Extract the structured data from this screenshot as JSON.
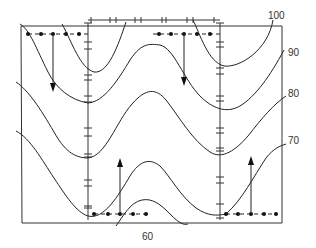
{
  "diagram": {
    "type": "contour-diagram",
    "contour_labels": [
      {
        "value": "100",
        "x": 284,
        "y": 18
      },
      {
        "value": "90",
        "x": 290,
        "y": 56
      },
      {
        "value": "80",
        "x": 290,
        "y": 97
      },
      {
        "value": "70",
        "x": 290,
        "y": 144
      },
      {
        "value": "60",
        "x": 144,
        "y": 240
      }
    ],
    "frame": {
      "left": 21,
      "top": 26,
      "right": 282,
      "bottom": 223
    },
    "error_bar_columns_x": [
      88,
      220
    ],
    "error_bar_row_y": 20,
    "dotted_rows": [
      {
        "name": "top-left",
        "y": 34,
        "dots_x": [
          28,
          41,
          53,
          66,
          79
        ]
      },
      {
        "name": "top-right",
        "y": 34,
        "dots_x": [
          159,
          171,
          184,
          197,
          210
        ]
      },
      {
        "name": "bottom-left",
        "y": 214,
        "dots_x": [
          94,
          108,
          120,
          133,
          146
        ]
      },
      {
        "name": "bottom-right",
        "y": 214,
        "dots_x": [
          226,
          238,
          251,
          264,
          276
        ]
      }
    ],
    "arrows": [
      {
        "direction": "down",
        "x": 53,
        "y1": 34,
        "y2": 90
      },
      {
        "direction": "down",
        "x": 184,
        "y1": 34,
        "y2": 84
      },
      {
        "direction": "up",
        "x": 120,
        "y1": 214,
        "y2": 160
      },
      {
        "direction": "up",
        "x": 251,
        "y1": 214,
        "y2": 158
      }
    ]
  }
}
